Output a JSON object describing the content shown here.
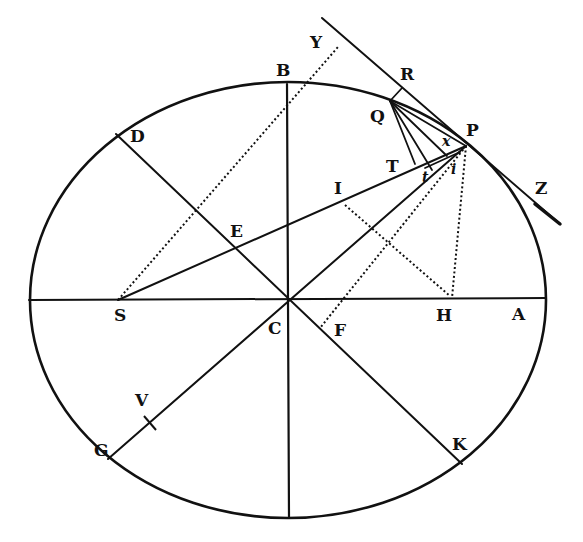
{
  "figure": {
    "stroke_color": "#111111",
    "background": "#ffffff"
  },
  "labels": {
    "Y": "Y",
    "B": "B",
    "R": "R",
    "Q": "Q",
    "P": "P",
    "x": "x",
    "D": "D",
    "T": "T",
    "t": "t",
    "i": "i",
    "Z": "Z",
    "I": "I",
    "E": "E",
    "S": "S",
    "C": "C",
    "F": "F",
    "H": "H",
    "A": "A",
    "V": "V",
    "G": "G",
    "K": "K"
  }
}
